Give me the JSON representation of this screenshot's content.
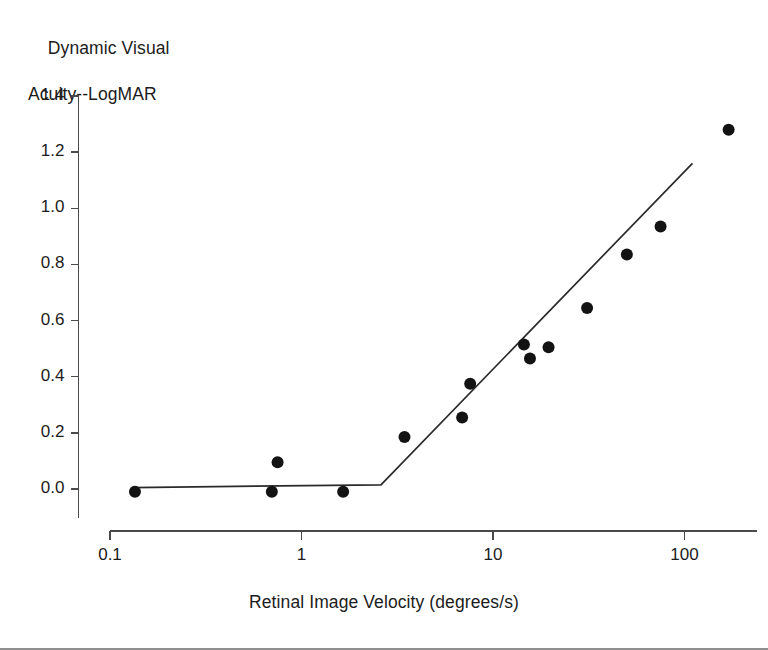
{
  "figure": {
    "y_axis_title_line1": "Dynamic Visual",
    "y_axis_title_line2": "Acuity--LogMAR",
    "x_axis_title": "Retinal Image Velocity (degrees/s)"
  },
  "chart_data": {
    "type": "scatter",
    "title": "",
    "xlabel": "Retinal Image Velocity (degrees/s)",
    "ylabel": "Dynamic Visual Acuity--LogMAR",
    "xscale": "log",
    "yscale": "linear",
    "xlim": [
      0.1,
      200
    ],
    "ylim": [
      0.0,
      1.4
    ],
    "grid": false,
    "legend": null,
    "x_ticks": [
      0.1,
      1,
      10,
      100
    ],
    "x_tick_labels": [
      "0.1",
      "1",
      "10",
      "100"
    ],
    "y_ticks": [
      0.0,
      0.2,
      0.4,
      0.6,
      0.8,
      1.0,
      1.2,
      1.4
    ],
    "y_tick_labels": [
      "0.0",
      "0.2",
      "0.4",
      "0.6",
      "0.8",
      "1.0",
      "1.2",
      "1.4"
    ],
    "marker": "filled-circle",
    "marker_color": "#131313",
    "marker_size": 11,
    "points": [
      {
        "x": 0.135,
        "y": -0.01
      },
      {
        "x": 0.7,
        "y": -0.01
      },
      {
        "x": 0.75,
        "y": 0.095
      },
      {
        "x": 1.65,
        "y": -0.01
      },
      {
        "x": 3.45,
        "y": 0.185
      },
      {
        "x": 6.9,
        "y": 0.255
      },
      {
        "x": 7.6,
        "y": 0.375
      },
      {
        "x": 14.5,
        "y": 0.515
      },
      {
        "x": 15.6,
        "y": 0.465
      },
      {
        "x": 19.5,
        "y": 0.505
      },
      {
        "x": 31.0,
        "y": 0.645
      },
      {
        "x": 50.0,
        "y": 0.835
      },
      {
        "x": 75.0,
        "y": 0.935
      },
      {
        "x": 170.0,
        "y": 1.28
      }
    ],
    "fit": {
      "name": "piecewise-linear-fit",
      "description": "flat segment then rising log-linear segment",
      "breakpoint_x": 2.6,
      "breakpoint_y": 0.015,
      "segments": [
        {
          "x_start": 0.13,
          "y_start": 0.005,
          "x_end": 2.6,
          "y_end": 0.015
        },
        {
          "x_start": 2.6,
          "y_start": 0.015,
          "x_end": 110.0,
          "y_end": 1.16
        }
      ]
    }
  }
}
